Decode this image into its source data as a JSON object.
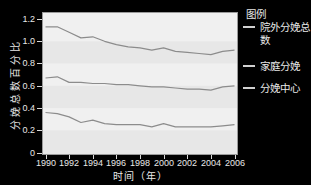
{
  "chart_data": {
    "type": "line",
    "title": "",
    "xlabel": "时间（年）",
    "ylabel": "分娩总数百分比",
    "legend_title": "图例",
    "legend_position": "right",
    "grid": false,
    "background_bands": true,
    "xlim": [
      1990,
      2006
    ],
    "ylim": [
      0,
      1.2
    ],
    "x": [
      1990,
      1991,
      1992,
      1993,
      1994,
      1995,
      1996,
      1997,
      1998,
      1999,
      2000,
      2001,
      2002,
      2003,
      2004,
      2005,
      2006
    ],
    "x_tick_labels": [
      "1990",
      "1992",
      "1994",
      "1996",
      "1998",
      "2000",
      "2002",
      "2004",
      "2006"
    ],
    "y_tick_labels": [
      "0",
      "0.2",
      "0.4",
      "0.6",
      "0.8",
      "1.0",
      "1.2"
    ],
    "series": [
      {
        "name": "院外分娩总数",
        "values": [
          1.13,
          1.13,
          1.08,
          1.03,
          1.04,
          1.0,
          0.97,
          0.95,
          0.94,
          0.92,
          0.94,
          0.91,
          0.9,
          0.89,
          0.88,
          0.91,
          0.92
        ]
      },
      {
        "name": "家庭分娩",
        "values": [
          0.67,
          0.68,
          0.63,
          0.63,
          0.62,
          0.62,
          0.61,
          0.61,
          0.6,
          0.59,
          0.59,
          0.58,
          0.57,
          0.57,
          0.56,
          0.59,
          0.6
        ]
      },
      {
        "name": "分娩中心",
        "values": [
          0.36,
          0.35,
          0.32,
          0.27,
          0.29,
          0.26,
          0.25,
          0.25,
          0.25,
          0.23,
          0.26,
          0.23,
          0.23,
          0.23,
          0.23,
          0.24,
          0.25
        ]
      }
    ],
    "colors": {
      "page_background": "#000000",
      "plot_background": "#f0f0f0",
      "band": "#e7e7e7",
      "line": "#8c8c8c",
      "axis_text": "#e8e8e8",
      "tick": "#d8d8d8",
      "plot_border": "#9a9a9a",
      "legend_dash": "#d0d0d0"
    }
  }
}
